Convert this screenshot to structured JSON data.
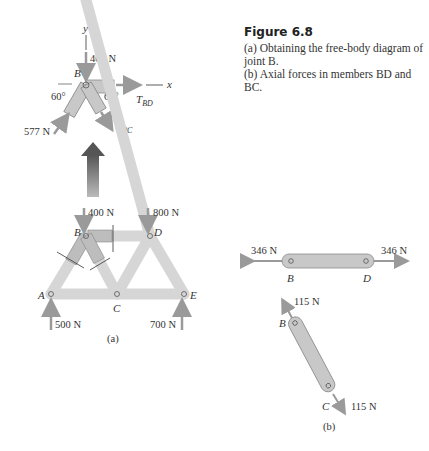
{
  "caption": {
    "title": "Figure 6.8",
    "line_a1": "(a) Obtaining the free-body diagram of",
    "line_a2": "joint B.",
    "line_b": "(b) Axial forces in members BD and BC."
  },
  "fbd_joint_b": {
    "axis_y": "y",
    "axis_x": "x",
    "joint": "B",
    "load": "400 N",
    "angle_left": "60°",
    "angle_right": "60°",
    "force_left": "577 N",
    "tension_bd": "T",
    "tension_bd_sub": "BD",
    "tension_bc": "T",
    "tension_bc_sub": "BC"
  },
  "truss": {
    "joints": [
      "A",
      "B",
      "C",
      "D",
      "E"
    ],
    "load_b": "400 N",
    "load_d": "800 N",
    "reaction_a": "500 N",
    "reaction_e": "700 N",
    "panel_label": "(a)"
  },
  "members": {
    "bd_left_force": "346 N",
    "bd_right_force": "346 N",
    "bd_end_left": "B",
    "bd_end_right": "D",
    "bc_top_force": "115 N",
    "bc_bottom_force": "115 N",
    "bc_end_top": "B",
    "bc_end_bottom": "C",
    "panel_label": "(b)"
  },
  "colors": {
    "member_fill": "#c8c8c8",
    "member_stroke": "#8a8a8a",
    "arrow": "#9a9a9a",
    "truss_fill": "#d6d6d6"
  }
}
